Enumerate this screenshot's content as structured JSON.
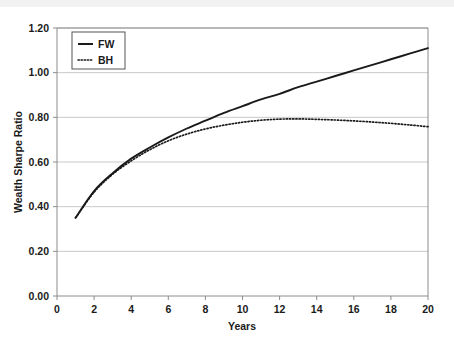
{
  "chart_data": {
    "type": "line",
    "title": "",
    "xlabel": "Years",
    "ylabel": "Wealth Sharpe Ratio",
    "xlim": [
      0,
      20
    ],
    "ylim": [
      0.0,
      1.2
    ],
    "xticks": [
      "0",
      "2",
      "4",
      "6",
      "8",
      "10",
      "12",
      "14",
      "16",
      "18",
      "20"
    ],
    "xtick_values": [
      0,
      2,
      4,
      6,
      8,
      10,
      12,
      14,
      16,
      18,
      20
    ],
    "yticks": [
      "0.00",
      "0.20",
      "0.40",
      "0.60",
      "0.80",
      "1.00",
      "1.20"
    ],
    "ytick_values": [
      0.0,
      0.2,
      0.4,
      0.6,
      0.8,
      1.0,
      1.2
    ],
    "grid": "horizontal",
    "legend_position": "top-left-inside",
    "x": [
      1,
      2,
      3,
      4,
      5,
      6,
      7,
      8,
      9,
      10,
      11,
      12,
      13,
      14,
      15,
      16,
      17,
      18,
      19,
      20
    ],
    "series": [
      {
        "name": "FW",
        "style": "solid",
        "color": "#1a1a1a",
        "values": [
          0.35,
          0.47,
          0.55,
          0.615,
          0.665,
          0.71,
          0.75,
          0.785,
          0.82,
          0.85,
          0.88,
          0.905,
          0.935,
          0.96,
          0.985,
          1.01,
          1.035,
          1.06,
          1.085,
          1.11
        ]
      },
      {
        "name": "BH",
        "style": "dotted",
        "color": "#1a1a1a",
        "values": [
          0.35,
          0.465,
          0.545,
          0.605,
          0.655,
          0.695,
          0.725,
          0.748,
          0.765,
          0.778,
          0.787,
          0.792,
          0.793,
          0.791,
          0.788,
          0.784,
          0.779,
          0.773,
          0.766,
          0.758
        ]
      }
    ]
  },
  "legend": {
    "items": [
      {
        "label": "FW",
        "style": "solid"
      },
      {
        "label": "BH",
        "style": "dotted"
      }
    ]
  }
}
